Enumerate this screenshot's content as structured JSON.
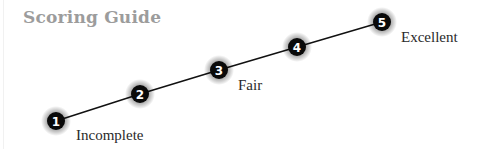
{
  "title": "Scoring Guide",
  "colors": {
    "title": "#9c9c9c",
    "line": "#111111",
    "marker_fill": "#0a0a0a",
    "marker_text": "#ffffff",
    "label_text": "#2a2a2a"
  },
  "scale": {
    "points": [
      {
        "number": "1",
        "x": 56,
        "y": 121,
        "label": "Incomplete"
      },
      {
        "number": "2",
        "x": 140,
        "y": 94,
        "label": ""
      },
      {
        "number": "3",
        "x": 219,
        "y": 70,
        "label": "Fair"
      },
      {
        "number": "4",
        "x": 297,
        "y": 47,
        "label": ""
      },
      {
        "number": "5",
        "x": 382,
        "y": 22,
        "label": "Excellent"
      }
    ]
  }
}
